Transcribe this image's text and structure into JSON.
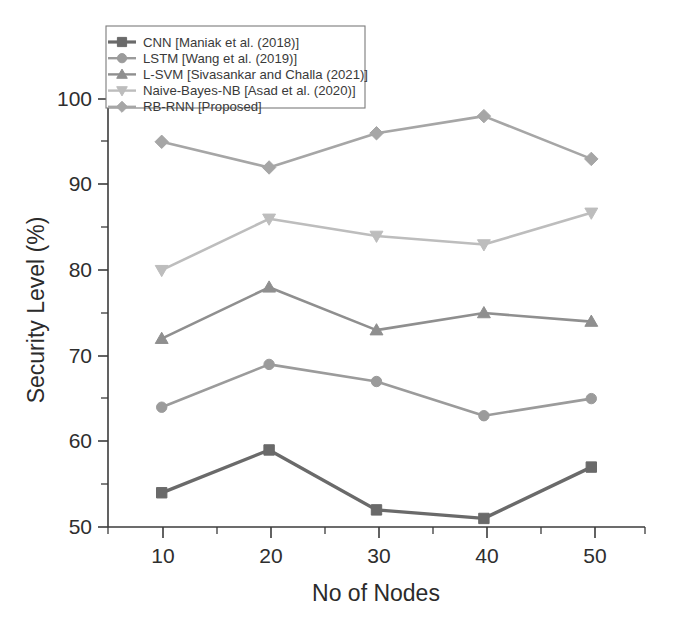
{
  "chart_data": {
    "type": "line",
    "title": "",
    "xlabel": "No of Nodes",
    "ylabel": "Security Level (%)",
    "categories": [
      10,
      20,
      30,
      40,
      50
    ],
    "x": [
      10,
      20,
      30,
      40,
      50
    ],
    "xlim": [
      5,
      55
    ],
    "ylim": [
      50,
      100
    ],
    "xticks": [
      "10",
      "20",
      "30",
      "40",
      "50"
    ],
    "yticks": [
      "50",
      "60",
      "70",
      "80",
      "90",
      "100"
    ],
    "grid": false,
    "legend_position": "top-left",
    "series": [
      {
        "name": "CNN [Maniak et al. (2018)]",
        "marker": "square",
        "color": "#6a6a6a",
        "values": [
          54,
          59,
          52,
          51,
          57
        ]
      },
      {
        "name": "LSTM [Wang et al. (2019)]",
        "marker": "circle",
        "color": "#9b9b9b",
        "values": [
          64,
          69,
          67,
          63,
          65
        ]
      },
      {
        "name": "L-SVM [Sivasankar and Challa (2021)]",
        "marker": "triangle-up",
        "color": "#8f8f8f",
        "values": [
          72,
          78,
          73,
          75,
          74
        ]
      },
      {
        "name": "Naive-Bayes-NB [Asad et al. (2020)]",
        "marker": "triangle-down",
        "color": "#bdbdbd",
        "values": [
          80,
          86,
          84,
          83,
          86.7
        ]
      },
      {
        "name": "RB-RNN [Proposed]",
        "marker": "diamond",
        "color": "#a6a6a6",
        "values": [
          95,
          92,
          96,
          98,
          93
        ]
      }
    ]
  },
  "axes": {
    "x_title": "No of Nodes",
    "y_title": "Security Level (%)",
    "x_tick_labels": [
      "10",
      "20",
      "30",
      "40",
      "50"
    ],
    "y_tick_labels": [
      "50",
      "60",
      "70",
      "80",
      "90",
      "100"
    ]
  },
  "legend": {
    "entries": [
      {
        "label": "CNN [Maniak et al. (2018)]"
      },
      {
        "label": "LSTM [Wang et al. (2019)]"
      },
      {
        "label": "L-SVM [Sivasankar and Challa (2021)]"
      },
      {
        "label": "Naive-Bayes-NB [Asad et al. (2020)]"
      },
      {
        "label": "RB-RNN [Proposed]"
      }
    ]
  }
}
